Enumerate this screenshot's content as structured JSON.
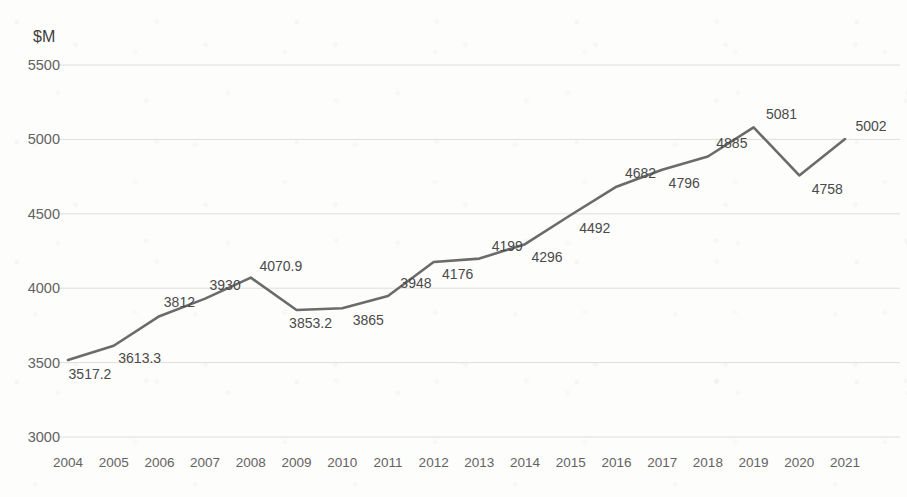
{
  "chart_data": {
    "type": "line",
    "title": "",
    "xlabel": "",
    "ylabel": "$M",
    "ylim": [
      3000,
      5500
    ],
    "yticks": [
      3000,
      3500,
      4000,
      4500,
      5000,
      5500
    ],
    "grid": true,
    "legend": "none",
    "line_color": "#6b6b6b",
    "categories": [
      "2004",
      "2005",
      "2006",
      "2007",
      "2008",
      "2009",
      "2010",
      "2011",
      "2012",
      "2013",
      "2014",
      "2015",
      "2016",
      "2017",
      "2018",
      "2019",
      "2020",
      "2021"
    ],
    "values": [
      3517.2,
      3613.3,
      3812,
      3930,
      4070.9,
      3853.2,
      3865,
      3948,
      4176,
      4199,
      4296,
      4492,
      4682,
      4796,
      4885,
      5081,
      4758,
      5002
    ],
    "data_labels": [
      "3517.2",
      "3613.3",
      "3812",
      "3930",
      "4070.9",
      "3853.2",
      "3865",
      "3948",
      "4176",
      "4199",
      "4296",
      "4492",
      "4682",
      "4796",
      "4885",
      "5081",
      "4758",
      "5002"
    ],
    "ytick_labels": [
      "3000",
      "5500",
      "5000",
      "4500",
      "4000",
      "3500"
    ]
  },
  "axis": {
    "y_title": "$M",
    "y_tick_labels": [
      "5500",
      "5000",
      "4500",
      "4000",
      "3500",
      "3000"
    ],
    "x_tick_labels": [
      "2004",
      "2005",
      "2006",
      "2007",
      "2008",
      "2009",
      "2010",
      "2011",
      "2012",
      "2013",
      "2014",
      "2015",
      "2016",
      "2017",
      "2018",
      "2019",
      "2020",
      "2021"
    ]
  }
}
